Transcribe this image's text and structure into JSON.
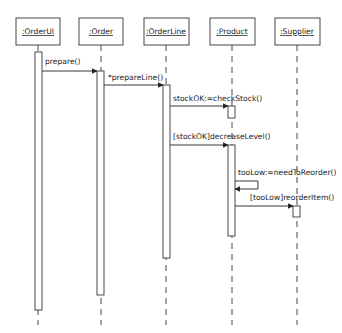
{
  "diagram": {
    "type": "sequence",
    "participants": [
      {
        "id": "orderui",
        "label": ":OrderUI",
        "x": 38
      },
      {
        "id": "order",
        "label": ":Order",
        "x": 101
      },
      {
        "id": "orderline",
        "label": ":OrderLine",
        "x": 166
      },
      {
        "id": "product",
        "label": ":Product",
        "x": 232
      },
      {
        "id": "supplier",
        "label": ":Supplier",
        "x": 297
      }
    ],
    "messages": [
      {
        "label": "prepare()",
        "from": "orderui",
        "to": "order"
      },
      {
        "label": "*prepareLine()",
        "from": "order",
        "to": "orderline"
      },
      {
        "label": "stockOK:=checkStock()",
        "from": "orderline",
        "to": "product"
      },
      {
        "label": "[stockOK]decreaseLevel()",
        "from": "orderline",
        "to": "product"
      },
      {
        "label": "tooLow:=needToReorder()",
        "from": "product",
        "to": "product"
      },
      {
        "label": "[tooLow]reorderItem()",
        "from": "product",
        "to": "supplier"
      }
    ]
  }
}
